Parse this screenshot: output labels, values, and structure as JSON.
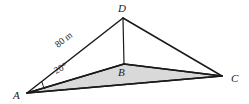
{
  "figure": {
    "background_color": "#ffffff",
    "stroke_color": "#1a1a1a",
    "shaded_face_color": "#d9d9d9"
  },
  "vertices": [
    {
      "id": "A",
      "label": "A",
      "x": 27,
      "y": 93,
      "label_x": 13,
      "label_y": 99
    },
    {
      "id": "B",
      "label": "B",
      "x": 124,
      "y": 64,
      "label_x": 118,
      "label_y": 76
    },
    {
      "id": "C",
      "label": "C",
      "x": 222,
      "y": 76,
      "label_x": 231,
      "label_y": 82
    },
    {
      "id": "D",
      "label": "D",
      "x": 123,
      "y": 18,
      "label_x": 118,
      "label_y": 12
    }
  ],
  "edges": [
    {
      "id": "AD",
      "from": "A",
      "to": "D",
      "weight": "thick"
    },
    {
      "id": "DC",
      "from": "D",
      "to": "C",
      "weight": "thick"
    },
    {
      "id": "DB",
      "from": "D",
      "to": "B",
      "weight": "thin"
    },
    {
      "id": "AB",
      "from": "A",
      "to": "B",
      "weight": "thick"
    },
    {
      "id": "BC",
      "from": "B",
      "to": "C",
      "weight": "thick"
    },
    {
      "id": "AC",
      "from": "A",
      "to": "C",
      "weight": "thick"
    }
  ],
  "shaded_face": {
    "id": "ABC",
    "points": "27,93 124,64 222,76",
    "fill": "#d9d9d9"
  },
  "annotations": {
    "side_length": {
      "text": "80 m",
      "x": 58,
      "y": 48,
      "rotation": -32
    },
    "angle": {
      "text": "20°",
      "x": 58,
      "y": 73,
      "rotation": -24
    },
    "angle_arc": {
      "path": "M 45 89 A 19 19 0 0 1 42 82"
    }
  }
}
